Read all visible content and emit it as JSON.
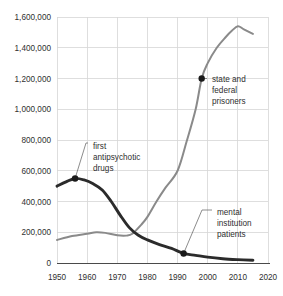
{
  "chart_data": {
    "type": "line",
    "title": "",
    "subtitle": "",
    "xlabel": "",
    "ylabel": "",
    "xlim": [
      1950,
      2020
    ],
    "ylim": [
      0,
      1600000
    ],
    "grid": true,
    "legend_position": "annotations-inline",
    "x_ticks": [
      "1950",
      "1960",
      "1970",
      "1980",
      "1990",
      "2000",
      "2010",
      "2020"
    ],
    "y_ticks": [
      "0",
      "200,000",
      "400,000",
      "600,000",
      "800,000",
      "1,000,000",
      "1,200,000",
      "1,400,000",
      "1,600,000"
    ],
    "series": [
      {
        "name": "state and federal prisoners",
        "color": "#8a8a8a",
        "x": [
          1950,
          1955,
          1960,
          1963,
          1966,
          1970,
          1973,
          1975,
          1978,
          1980,
          1983,
          1986,
          1990,
          1993,
          1996,
          1998,
          2000,
          2003,
          2006,
          2008,
          2010,
          2012,
          2015
        ],
        "values": [
          150000,
          175000,
          190000,
          200000,
          196000,
          180000,
          178000,
          190000,
          250000,
          300000,
          400000,
          490000,
          600000,
          790000,
          1000000,
          1200000,
          1300000,
          1400000,
          1470000,
          1510000,
          1540000,
          1520000,
          1490000
        ]
      },
      {
        "name": "mental institution patients",
        "color": "#2b2b2b",
        "x": [
          1950,
          1953,
          1956,
          1959,
          1962,
          1965,
          1968,
          1971,
          1974,
          1977,
          1980,
          1984,
          1988,
          1992,
          1996,
          2000,
          2005,
          2010,
          2015
        ],
        "values": [
          500000,
          528000,
          550000,
          540000,
          515000,
          475000,
          400000,
          310000,
          230000,
          180000,
          150000,
          120000,
          95000,
          62000,
          50000,
          38000,
          28000,
          22000,
          18000
        ]
      }
    ],
    "annotations": [
      {
        "id": "first-antipsychotic-drugs",
        "lines": [
          "first",
          "antipsychotic",
          "drugs"
        ],
        "point_x": 1956,
        "point_y": 550000,
        "marker": "dot"
      },
      {
        "id": "state-and-federal-prisoners",
        "lines": [
          "state and",
          "federal",
          "prisoners"
        ],
        "point_x": 1998,
        "point_y": 1200000,
        "marker": "dot"
      },
      {
        "id": "mental-institution-patients",
        "lines": [
          "mental",
          "institution",
          "patients"
        ],
        "point_x": 1992,
        "point_y": 62000,
        "marker": "dot"
      }
    ]
  },
  "colors": {
    "prisoners_line": "#8a8a8a",
    "patients_line": "#2b2b2b",
    "grid": "#d6d6d6",
    "axis": "#4a4a4a",
    "text": "#2f2f2f",
    "background": "#ffffff"
  }
}
